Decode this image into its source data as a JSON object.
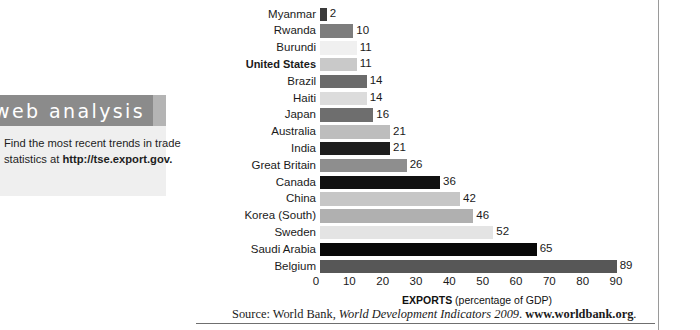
{
  "sidebar": {
    "banner_title": "web analysis",
    "body_text_1": "Find the most recent trends in trade",
    "body_text_2_prefix": "statistics at ",
    "body_url": "http://tse.export.gov."
  },
  "chart_data": {
    "type": "bar",
    "orientation": "horizontal",
    "title": "",
    "xlabel_strong": "EXPORTS",
    "xlabel_rest": " (percentage of GDP)",
    "ylabel": "",
    "xlim": [
      0,
      90
    ],
    "xticks": [
      0,
      10,
      20,
      30,
      40,
      50,
      60,
      70,
      80,
      90
    ],
    "grid": false,
    "legend": "none",
    "highlight_category": "United States",
    "categories": [
      "Myanmar",
      "Rwanda",
      "Burundi",
      "United States",
      "Brazil",
      "Haiti",
      "Japan",
      "Australia",
      "India",
      "Great Britain",
      "Canada",
      "China",
      "Korea (South)",
      "Sweden",
      "Saudi Arabia",
      "Belgium"
    ],
    "values": [
      2,
      10,
      11,
      11,
      14,
      14,
      16,
      21,
      21,
      26,
      36,
      42,
      46,
      52,
      65,
      89
    ],
    "bar_colors": [
      "#3a3a3a",
      "#7d7d7d",
      "#f0f0f0",
      "#c9c9c9",
      "#6b6b6b",
      "#dcdcdc",
      "#6e6e6e",
      "#bdbdbd",
      "#1e1e1e",
      "#8e8e8e",
      "#111111",
      "#c6c6c6",
      "#b0b0b0",
      "#e4e4e4",
      "#080808",
      "#575757"
    ]
  },
  "source": {
    "prefix": "Source: World Bank, ",
    "italic": "World Development Indicators 2009",
    "middle": ". ",
    "url": "www.worldbank.org",
    "suffix": "."
  }
}
